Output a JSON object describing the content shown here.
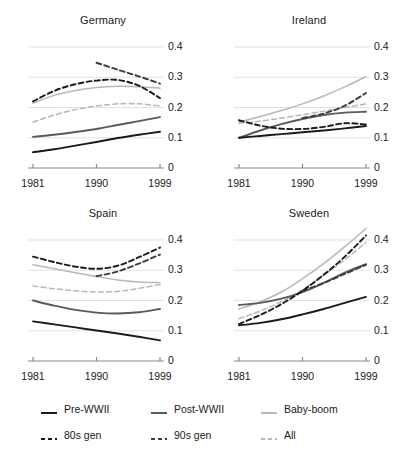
{
  "figure": {
    "title": "",
    "panel_layout": "2x2 small multiples"
  },
  "axes": {
    "yticks": [
      "0.4",
      "0.3",
      "0.2",
      "0.1",
      "0"
    ],
    "ytick_values": [
      0.4,
      0.3,
      0.2,
      0.1,
      0.0
    ],
    "xticks": [
      "1981",
      "1990",
      "1999"
    ],
    "xtick_values": [
      1981,
      1990,
      1999
    ],
    "ylim": [
      0,
      0.4
    ],
    "xlim": [
      1981,
      1999
    ]
  },
  "legend": {
    "position": "bottom-center",
    "rows": [
      [
        {
          "label": "Pre-WWII",
          "style": "solid",
          "color": "#1a1a1a",
          "key": "pre_wwii"
        },
        {
          "label": "Post-WWII",
          "style": "solid",
          "color": "#5a5a5a",
          "key": "post_wwii"
        },
        {
          "label": "Baby-boom",
          "style": "solid",
          "color": "#b8b8b8",
          "key": "baby_boom"
        }
      ],
      [
        {
          "label": "80s gen",
          "style": "dashed",
          "color": "#1a1a1a",
          "key": "gen_80s"
        },
        {
          "label": "90s gen",
          "style": "dashed",
          "color": "#3d3d3d",
          "key": "gen_90s"
        },
        {
          "label": "All",
          "style": "dashed",
          "color": "#b8b8b8",
          "key": "all"
        }
      ]
    ]
  },
  "chart_data": {
    "type": "line",
    "title": "",
    "xlabel": "",
    "ylabel": "",
    "xlim": [
      1981,
      1999
    ],
    "ylim": [
      0,
      0.4
    ],
    "grid": "horizontal gridlines at 0.1, 0.2, 0.3, 0.4",
    "legend_position": "bottom-center",
    "panels": [
      {
        "name": "Germany",
        "x": [
          1981,
          1984,
          1987,
          1990,
          1993,
          1996,
          1999
        ],
        "series": [
          {
            "name": "Pre-WWII",
            "style": "solid",
            "color": "#1a1a1a",
            "values": [
              0.052,
              0.062,
              0.074,
              0.086,
              0.099,
              0.11,
              0.12
            ]
          },
          {
            "name": "Post-WWII",
            "style": "solid",
            "color": "#5a5a5a",
            "values": [
              0.103,
              0.11,
              0.119,
              0.129,
              0.142,
              0.155,
              0.168
            ]
          },
          {
            "name": "Baby-boom",
            "style": "solid",
            "color": "#b8b8b8",
            "values": [
              0.215,
              0.24,
              0.256,
              0.266,
              0.27,
              0.269,
              0.264
            ]
          },
          {
            "name": "80s gen",
            "style": "dashed",
            "color": "#1a1a1a",
            "values": [
              0.22,
              0.255,
              0.277,
              0.289,
              0.291,
              0.272,
              0.231
            ]
          },
          {
            "name": "90s gen",
            "style": "dashed",
            "color": "#3d3d3d",
            "x": [
              1990,
              1993,
              1996,
              1999
            ],
            "values": [
              0.348,
              0.325,
              0.303,
              0.279
            ]
          },
          {
            "name": "All",
            "style": "dashed",
            "color": "#b8b8b8",
            "values": [
              0.152,
              0.175,
              0.193,
              0.205,
              0.212,
              0.212,
              0.205
            ]
          }
        ]
      },
      {
        "name": "Ireland",
        "x": [
          1981,
          1984,
          1987,
          1990,
          1993,
          1996,
          1999
        ],
        "series": [
          {
            "name": "Pre-WWII",
            "style": "solid",
            "color": "#1a1a1a",
            "values": [
              0.1,
              0.106,
              0.112,
              0.118,
              0.124,
              0.131,
              0.139
            ]
          },
          {
            "name": "Post-WWII",
            "style": "solid",
            "color": "#5a5a5a",
            "values": [
              0.1,
              0.124,
              0.145,
              0.162,
              0.175,
              0.183,
              0.186
            ]
          },
          {
            "name": "Baby-boom",
            "style": "solid",
            "color": "#b8b8b8",
            "values": [
              0.152,
              0.17,
              0.19,
              0.212,
              0.238,
              0.268,
              0.302
            ]
          },
          {
            "name": "80s gen",
            "style": "dashed",
            "color": "#1a1a1a",
            "values": [
              0.158,
              0.14,
              0.13,
              0.129,
              0.136,
              0.148,
              0.144
            ]
          },
          {
            "name": "90s gen",
            "style": "dashed",
            "color": "#3d3d3d",
            "x": [
              1990,
              1993,
              1996,
              1999
            ],
            "values": [
              0.165,
              0.18,
              0.206,
              0.248
            ]
          },
          {
            "name": "All",
            "style": "dashed",
            "color": "#b8b8b8",
            "values": [
              0.148,
              0.155,
              0.165,
              0.176,
              0.188,
              0.2,
              0.212
            ]
          }
        ]
      },
      {
        "name": "Spain",
        "x": [
          1981,
          1984,
          1987,
          1990,
          1993,
          1996,
          1999
        ],
        "series": [
          {
            "name": "Pre-WWII",
            "style": "solid",
            "color": "#1a1a1a",
            "values": [
              0.131,
              0.121,
              0.111,
              0.101,
              0.091,
              0.08,
              0.068
            ]
          },
          {
            "name": "Post-WWII",
            "style": "solid",
            "color": "#5a5a5a",
            "values": [
              0.2,
              0.183,
              0.169,
              0.16,
              0.157,
              0.161,
              0.172
            ]
          },
          {
            "name": "Baby-boom",
            "style": "solid",
            "color": "#b8b8b8",
            "values": [
              0.318,
              0.305,
              0.292,
              0.279,
              0.268,
              0.261,
              0.259
            ]
          },
          {
            "name": "80s gen",
            "style": "dashed",
            "color": "#1a1a1a",
            "values": [
              0.345,
              0.327,
              0.312,
              0.305,
              0.315,
              0.343,
              0.375
            ]
          },
          {
            "name": "90s gen",
            "style": "dashed",
            "color": "#3d3d3d",
            "x": [
              1990,
              1993,
              1996,
              1999
            ],
            "values": [
              0.28,
              0.296,
              0.322,
              0.352
            ]
          },
          {
            "name": "All",
            "style": "dashed",
            "color": "#b8b8b8",
            "values": [
              0.248,
              0.239,
              0.232,
              0.228,
              0.23,
              0.24,
              0.253
            ]
          }
        ]
      },
      {
        "name": "Sweden",
        "x": [
          1981,
          1984,
          1987,
          1990,
          1993,
          1996,
          1999
        ],
        "series": [
          {
            "name": "Pre-WWII",
            "style": "solid",
            "color": "#1a1a1a",
            "values": [
              0.118,
              0.126,
              0.138,
              0.154,
              0.172,
              0.192,
              0.212
            ]
          },
          {
            "name": "Post-WWII",
            "style": "solid",
            "color": "#5a5a5a",
            "values": [
              0.185,
              0.192,
              0.206,
              0.228,
              0.258,
              0.292,
              0.32
            ]
          },
          {
            "name": "Baby-boom",
            "style": "solid",
            "color": "#b8b8b8",
            "values": [
              0.172,
              0.196,
              0.228,
              0.272,
              0.322,
              0.378,
              0.438
            ]
          },
          {
            "name": "80s gen",
            "style": "dashed",
            "color": "#1a1a1a",
            "values": [
              0.122,
              0.152,
              0.188,
              0.232,
              0.285,
              0.345,
              0.415
            ]
          },
          {
            "name": "90s gen",
            "style": "dashed",
            "color": "#3d3d3d",
            "x": [
              1990,
              1993,
              1996,
              1999
            ],
            "values": [
              0.232,
              0.258,
              0.288,
              0.318
            ]
          },
          {
            "name": "All",
            "style": "dashed",
            "color": "#b8b8b8",
            "values": [
              0.14,
              0.165,
              0.196,
              0.236,
              0.284,
              0.335,
              0.392
            ]
          }
        ]
      }
    ]
  }
}
